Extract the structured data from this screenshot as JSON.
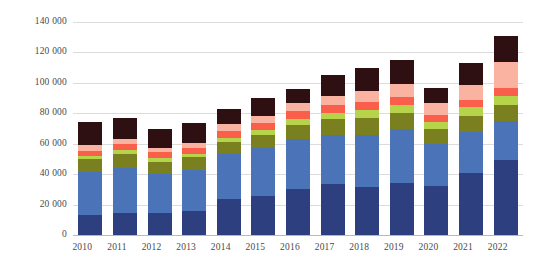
{
  "chart_data": {
    "type": "bar",
    "stacked": true,
    "title": "",
    "subtitle": "",
    "xlabel": "",
    "ylabel": "",
    "categories": [
      "2010",
      "2011",
      "2012",
      "2013",
      "2014",
      "2015",
      "2016",
      "2017",
      "2018",
      "2019",
      "2020",
      "2021",
      "2022"
    ],
    "ylim": [
      0,
      140000
    ],
    "yticks": [
      0,
      20000,
      40000,
      60000,
      80000,
      100000,
      120000,
      140000
    ],
    "ytick_labels": [
      "0",
      "20 000",
      "40 000",
      "60 000",
      "80 000",
      "100 000",
      "120 000",
      "140 000"
    ],
    "grid": true,
    "legend": "none",
    "series": [
      {
        "name": "series-1",
        "color": "#2e3f7f",
        "values": [
          13000,
          14500,
          14500,
          16000,
          23500,
          25500,
          30500,
          33500,
          31500,
          34000,
          32500,
          40500,
          49500
        ]
      },
      {
        "name": "series-2",
        "color": "#4a73b8",
        "values": [
          28500,
          29500,
          25500,
          26500,
          29500,
          31500,
          32500,
          32000,
          34500,
          35500,
          27500,
          27500,
          25500
        ]
      },
      {
        "name": "series-3",
        "color": "#7a8020",
        "values": [
          8500,
          9500,
          8000,
          8500,
          8000,
          8500,
          9500,
          10500,
          11000,
          10500,
          9500,
          10500,
          10500
        ]
      },
      {
        "name": "series-4",
        "color": "#b5d44a",
        "values": [
          2000,
          2500,
          2500,
          2500,
          3000,
          3500,
          4000,
          4500,
          5000,
          5500,
          5000,
          5500,
          6000
        ]
      },
      {
        "name": "series-5",
        "color": "#f95f4a",
        "values": [
          3500,
          4000,
          4000,
          4000,
          4500,
          4500,
          5000,
          5000,
          5500,
          5500,
          4500,
          5000,
          5000
        ]
      },
      {
        "name": "series-6",
        "color": "#f9b3a0",
        "values": [
          3500,
          3000,
          2500,
          3000,
          4500,
          5000,
          5500,
          6000,
          7000,
          8500,
          7500,
          9500,
          17000
        ]
      },
      {
        "name": "series-7",
        "color": "#2e0f12",
        "values": [
          15000,
          14000,
          12500,
          13000,
          10000,
          11500,
          9000,
          13500,
          15500,
          15500,
          10000,
          14500,
          17500
        ]
      }
    ],
    "totals": [
      74000,
      77000,
      69500,
      73500,
      83000,
      90000,
      96000,
      105000,
      110000,
      115000,
      96500,
      113000,
      131000
    ]
  }
}
